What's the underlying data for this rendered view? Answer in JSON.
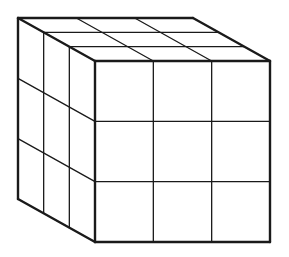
{
  "diagram": {
    "type": "cube-grid",
    "dimensions": [
      3,
      3,
      3
    ],
    "stroke_color": "#1a1a1a",
    "background": "#ffffff",
    "front_face": {
      "x0": 95,
      "y0": 61,
      "x1": 270,
      "y1": 242
    },
    "depth_offset": {
      "dx": -77,
      "dy": -43
    }
  }
}
